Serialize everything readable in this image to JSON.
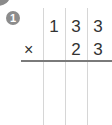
{
  "problem": {
    "number": "1",
    "operator": "×",
    "top_row": [
      "1",
      "3",
      "3"
    ],
    "bottom_row": [
      "",
      "2",
      "3"
    ]
  }
}
